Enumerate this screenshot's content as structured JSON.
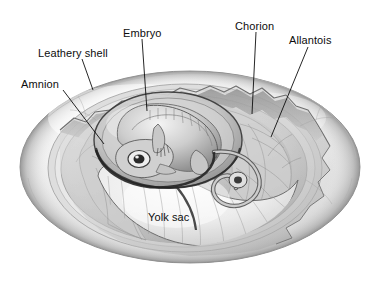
{
  "figure": {
    "background_color": "#ffffff",
    "ink_color": "#0d0d0d",
    "shell_light": "#f2f2f2",
    "shell_mid": "#cfcfcf",
    "shell_dark": "#9a9a9a",
    "membrane_tone": "#d8d8d8",
    "embryo_tone": "#bdbdbd",
    "yolk_tone": "#f0f0f0"
  },
  "labels": [
    {
      "id": "leathery-shell",
      "text": "Leathery shell",
      "x": 38,
      "y": 48,
      "leader": {
        "x1": 82,
        "y1": 59,
        "x2": 93,
        "y2": 90
      }
    },
    {
      "id": "amnion",
      "text": "Amnion",
      "x": 21,
      "y": 79,
      "leader": {
        "x1": 63,
        "y1": 90,
        "x2": 104,
        "y2": 144
      }
    },
    {
      "id": "embryo",
      "text": "Embryo",
      "x": 123,
      "y": 28,
      "leader": {
        "x1": 142,
        "y1": 39,
        "x2": 147,
        "y2": 111
      }
    },
    {
      "id": "chorion",
      "text": "Chorion",
      "x": 235,
      "y": 21,
      "leader": {
        "x1": 256,
        "y1": 32,
        "x2": 252,
        "y2": 114
      }
    },
    {
      "id": "allantois",
      "text": "Allantois",
      "x": 289,
      "y": 35,
      "leader": {
        "x1": 308,
        "y1": 47,
        "x2": 271,
        "y2": 137
      }
    },
    {
      "id": "yolk-sac",
      "text": "Yolk sac",
      "x": 148,
      "y": 212,
      "leader": null
    }
  ]
}
